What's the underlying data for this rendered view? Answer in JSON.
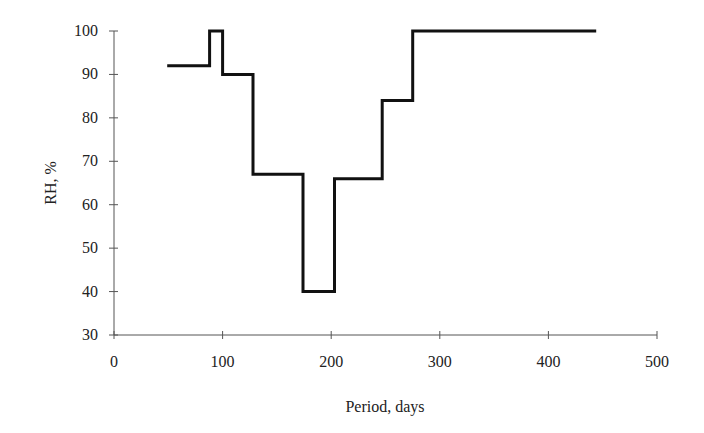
{
  "chart_data": {
    "type": "line",
    "style": "step",
    "title": "",
    "xlabel": "Period, days",
    "ylabel": "RH, %",
    "xlim": [
      0,
      500
    ],
    "ylim": [
      30,
      100
    ],
    "xticks": [
      0,
      100,
      200,
      300,
      400,
      500
    ],
    "yticks": [
      30,
      40,
      50,
      60,
      70,
      80,
      90,
      100
    ],
    "xtick_labels": [
      "0",
      "100",
      "200",
      "300",
      "400",
      "500"
    ],
    "ytick_labels": [
      "30",
      "40",
      "50",
      "60",
      "70",
      "80",
      "90",
      "100"
    ],
    "grid": false,
    "legend": null,
    "series": [
      {
        "name": "RH",
        "points": [
          [
            49,
            92
          ],
          [
            88,
            92
          ],
          [
            88,
            100
          ],
          [
            100,
            100
          ],
          [
            100,
            90
          ],
          [
            128,
            90
          ],
          [
            128,
            67
          ],
          [
            174,
            67
          ],
          [
            174,
            40
          ],
          [
            203,
            40
          ],
          [
            203,
            66
          ],
          [
            247,
            66
          ],
          [
            247,
            84
          ],
          [
            275,
            84
          ],
          [
            275,
            100
          ],
          [
            444,
            100
          ]
        ]
      }
    ]
  }
}
